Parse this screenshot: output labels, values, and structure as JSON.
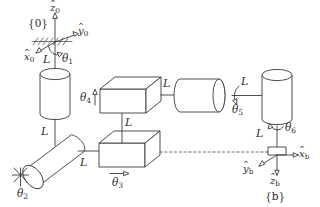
{
  "figure": {
    "line_color": "#3a3a3a",
    "background": "#ffffff"
  },
  "frames": {
    "base": {
      "name": "{0}",
      "axes": [
        {
          "id": "z0",
          "symbol": "z",
          "subscript": "0",
          "direction": "up"
        },
        {
          "id": "y0",
          "symbol": "y",
          "subscript": "0",
          "direction": "right"
        },
        {
          "id": "x0",
          "symbol": "x",
          "subscript": "0",
          "direction": "down-left"
        }
      ]
    },
    "body": {
      "name": "{b}",
      "axes": [
        {
          "id": "xb",
          "symbol": "x",
          "subscript": "b",
          "direction": "right"
        },
        {
          "id": "yb",
          "symbol": "y",
          "subscript": "b",
          "direction": "down-left"
        },
        {
          "id": "zb",
          "symbol": "z",
          "subscript": "b",
          "direction": "down"
        }
      ]
    }
  },
  "joints": [
    {
      "id": "theta1",
      "symbol": "θ",
      "subscript": "1",
      "type": "revolute",
      "shape": "cylinder-vertical"
    },
    {
      "id": "theta2",
      "symbol": "θ",
      "subscript": "2",
      "type": "revolute",
      "shape": "cylinder-oblique"
    },
    {
      "id": "theta3",
      "symbol": "θ",
      "subscript": "3",
      "type": "revolute",
      "shape": "box"
    },
    {
      "id": "theta4",
      "symbol": "θ",
      "subscript": "4",
      "type": "revolute",
      "shape": "box"
    },
    {
      "id": "theta5",
      "symbol": "θ",
      "subscript": "5",
      "type": "revolute",
      "shape": "cylinder-horizontal"
    },
    {
      "id": "theta6",
      "symbol": "θ",
      "subscript": "6",
      "type": "revolute",
      "shape": "cylinder-vertical"
    }
  ],
  "links": [
    {
      "id": "L-base-to-j1",
      "label": "L"
    },
    {
      "id": "L-j1-to-j2",
      "label": "L"
    },
    {
      "id": "L-j2-to-j3",
      "label": "L"
    },
    {
      "id": "L-j3-to-j4",
      "label": "L"
    },
    {
      "id": "L-j4-to-j5",
      "label": "L"
    },
    {
      "id": "L-j5-to-j6",
      "label": "L"
    },
    {
      "id": "L-j6-to-b",
      "label": "L"
    }
  ],
  "link_label": "L"
}
